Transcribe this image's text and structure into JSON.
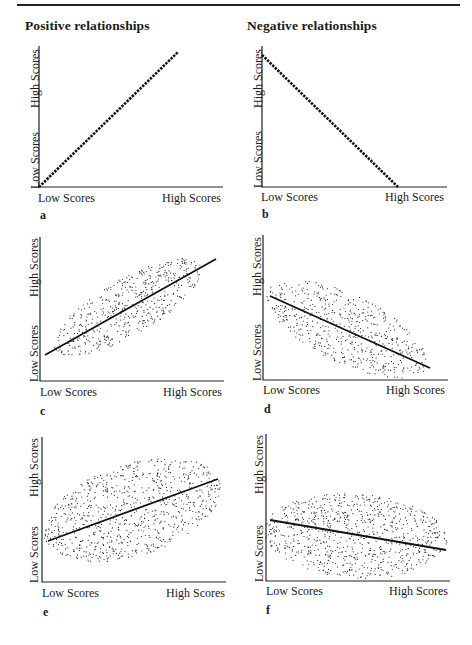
{
  "headings": {
    "positive": "Positive relationships",
    "negative": "Negative relationships"
  },
  "axis_labels": {
    "x_low": "Low Scores",
    "x_high": "High Scores",
    "y_low": "Low Scores",
    "y_high": "High Scores"
  },
  "panels": [
    {
      "id": "a",
      "letter": "a",
      "type": "perfect-positive",
      "column": "positive"
    },
    {
      "id": "b",
      "letter": "b",
      "type": "perfect-negative",
      "column": "negative"
    },
    {
      "id": "c",
      "letter": "c",
      "type": "strong-positive-scatter",
      "column": "positive"
    },
    {
      "id": "d",
      "letter": "d",
      "type": "strong-negative-scatter",
      "column": "negative"
    },
    {
      "id": "e",
      "letter": "e",
      "type": "weak-positive-scatter",
      "column": "positive"
    },
    {
      "id": "f",
      "letter": "f",
      "type": "weak-negative-scatter",
      "column": "negative"
    }
  ],
  "chart_data": [
    {
      "type": "line",
      "panel": "a",
      "title": "Positive relationships",
      "xlabel": [
        "Low Scores",
        "High Scores"
      ],
      "ylabel": [
        "Low Scores",
        "High Scores"
      ],
      "relationship": "perfect positive",
      "line": [
        [
          0,
          0
        ],
        [
          1,
          1
        ]
      ]
    },
    {
      "type": "line",
      "panel": "b",
      "title": "Negative relationships",
      "xlabel": [
        "Low Scores",
        "High Scores"
      ],
      "ylabel": [
        "Low Scores",
        "High Scores"
      ],
      "relationship": "perfect negative",
      "line": [
        [
          0,
          0.94
        ],
        [
          0.73,
          0
        ]
      ]
    },
    {
      "type": "scatter",
      "panel": "c",
      "xlabel": [
        "Low Scores",
        "High Scores"
      ],
      "ylabel": [
        "Low Scores",
        "High Scores"
      ],
      "relationship": "strong positive",
      "regression_line": [
        [
          0.03,
          0.18
        ],
        [
          0.98,
          0.85
        ]
      ]
    },
    {
      "type": "scatter",
      "panel": "d",
      "xlabel": [
        "Low Scores",
        "High Scores"
      ],
      "ylabel": [
        "Low Scores",
        "High Scores"
      ],
      "relationship": "strong negative",
      "regression_line": [
        [
          0.04,
          0.58
        ],
        [
          0.92,
          0.08
        ]
      ]
    },
    {
      "type": "scatter",
      "panel": "e",
      "xlabel": [
        "Low Scores",
        "High Scores"
      ],
      "ylabel": [
        "Low Scores",
        "High Scores"
      ],
      "relationship": "weak positive",
      "regression_line": [
        [
          0.03,
          0.28
        ],
        [
          0.98,
          0.71
        ]
      ]
    },
    {
      "type": "scatter",
      "panel": "f",
      "xlabel": [
        "Low Scores",
        "High Scores"
      ],
      "ylabel": [
        "Low Scores",
        "High Scores"
      ],
      "relationship": "weak negative",
      "regression_line": [
        [
          0.02,
          0.42
        ],
        [
          0.97,
          0.21
        ]
      ]
    }
  ]
}
